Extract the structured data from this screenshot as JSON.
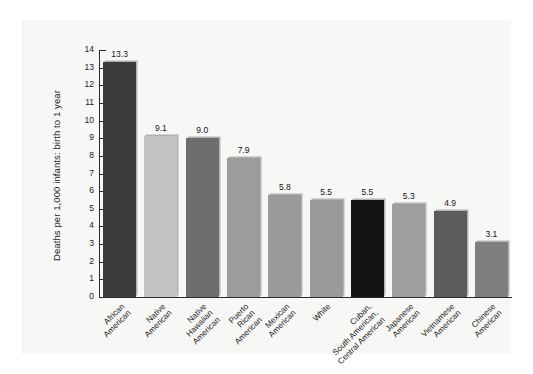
{
  "chart_data": {
    "type": "bar",
    "title": "",
    "subtitle": "",
    "xlabel": "",
    "ylabel": "Deaths per 1,000 infants: birth to 1 year",
    "ylim": [
      0,
      14
    ],
    "ytick_step": 1,
    "yticks": [
      "14",
      "13",
      "12",
      "11",
      "10",
      "9",
      "8",
      "7",
      "6",
      "5",
      "4",
      "3",
      "2",
      "1",
      "0"
    ],
    "grid": false,
    "legend": "none",
    "xtick_rotation": -45,
    "categories": [
      "African American",
      "Native American",
      "Native Hawaiian American",
      "Puerto Rican American",
      "Mexican American",
      "White",
      "Cuban, South American, Central American",
      "Japanese American",
      "Vietnamese American",
      "Chinese American"
    ],
    "category_lines": [
      [
        "African",
        "American"
      ],
      [
        "Native",
        "American"
      ],
      [
        "Native",
        "Hawaiian",
        "American"
      ],
      [
        "Puerto",
        "Rican",
        "American"
      ],
      [
        "Mexican",
        "American"
      ],
      [
        "White"
      ],
      [
        "Cuban,",
        "South American,",
        "Central American"
      ],
      [
        "Japanese",
        "American"
      ],
      [
        "Vietnamese",
        "American"
      ],
      [
        "Chinese",
        "American"
      ]
    ],
    "values": [
      13.3,
      9.1,
      9.0,
      7.9,
      5.8,
      5.5,
      5.5,
      5.3,
      4.9,
      3.1
    ],
    "value_labels": [
      "13.3",
      "9.1",
      "9.0",
      "7.9",
      "5.8",
      "5.5",
      "5.5",
      "5.3",
      "4.9",
      "3.1"
    ],
    "bar_colors": [
      "#3b3b3b",
      "#c3c3c3",
      "#6e6e6e",
      "#9c9c9c",
      "#9a9a9a",
      "#9a9a9a",
      "#141414",
      "#9e9e9e",
      "#5c5c5c",
      "#7e7e7e"
    ]
  },
  "colors": {
    "axis": "#2b2b2b",
    "panel_background": "#f7f7f5",
    "page_background": "#ffffff",
    "text": "#1b1b1b"
  }
}
